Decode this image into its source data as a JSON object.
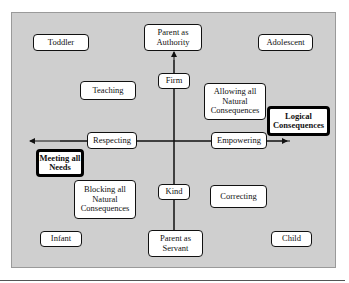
{
  "diagram": {
    "vertical_axis": {
      "top": "Parent as\nAuthority",
      "top_mid": "Firm",
      "bottom_mid": "Kind",
      "bottom": "Parent as\nServant"
    },
    "horizontal_axis": {
      "left_mid": "Respecting",
      "left": "Meeting all\nNeeds",
      "right_mid": "Empowering",
      "right": "Logical\nConsequences"
    },
    "corners": {
      "top_left": "Toddler",
      "top_right": "Adolescent",
      "bottom_left": "Infant",
      "bottom_right": "Child"
    },
    "quadrants": {
      "top_left": "Teaching",
      "top_right": "Allowing all\nNatural\nConsequences",
      "bottom_left": "Blocking all\nNatural\nConsequences",
      "bottom_right": "Correcting"
    }
  }
}
